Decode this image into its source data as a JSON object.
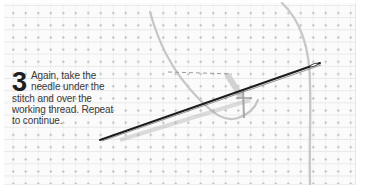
{
  "illustration": {
    "subject": "needlework-step-illustration",
    "step": {
      "number": "3",
      "line1": "Again, take the",
      "line2": "needle under the",
      "line3": "stitch and over the",
      "line4": "working thread. Repeat",
      "line5": "to continue."
    },
    "elements": [
      "even-weave-fabric",
      "needle",
      "working-thread",
      "stitch"
    ],
    "colors": {
      "fabric": "#fbfbfb",
      "needle": "#1f1f1f",
      "thread": "#c9c9c9",
      "text": "#3a3a3a"
    }
  }
}
